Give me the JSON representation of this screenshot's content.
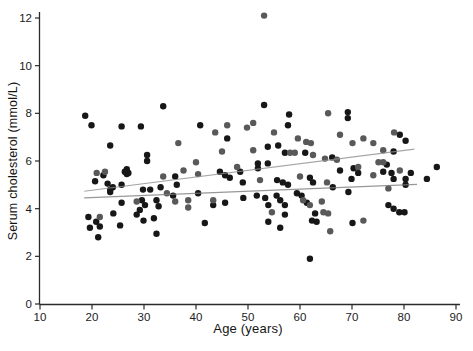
{
  "chart_data": {
    "type": "scatter",
    "title": "",
    "xlabel": "Age (years)",
    "ylabel": "Serum cholesterol (mmol/L)",
    "xlim": [
      10,
      90
    ],
    "ylim": [
      0,
      12
    ],
    "xticks": [
      10,
      20,
      30,
      40,
      50,
      60,
      70,
      80,
      90
    ],
    "yticks": [
      0,
      2,
      4,
      6,
      8,
      10,
      12
    ],
    "grid": false,
    "legend": "none",
    "marker": "filled-circle",
    "marker_radius_px": 3.2,
    "axis_color": "#2b2b2b",
    "series": [
      {
        "name": "black-points",
        "color": "#171717",
        "points": [
          [
            18.7,
            7.9
          ],
          [
            19.9,
            7.5
          ],
          [
            25.7,
            7.45
          ],
          [
            29.4,
            7.45
          ],
          [
            33.7,
            8.3
          ],
          [
            23.5,
            6.65
          ],
          [
            30.6,
            6.25
          ],
          [
            30.6,
            6.0
          ],
          [
            26.7,
            5.65
          ],
          [
            26.7,
            5.45
          ],
          [
            22.2,
            5.4
          ],
          [
            20.6,
            5.15
          ],
          [
            23.0,
            5.05
          ],
          [
            25.7,
            5.0
          ],
          [
            36.0,
            5.35
          ],
          [
            33.2,
            4.9
          ],
          [
            36.3,
            5.0
          ],
          [
            24.0,
            4.9
          ],
          [
            23.5,
            4.7
          ],
          [
            26.3,
            5.55
          ],
          [
            27.0,
            5.5
          ],
          [
            19.3,
            3.65
          ],
          [
            24.1,
            3.8
          ],
          [
            19.6,
            3.2
          ],
          [
            20.8,
            3.45
          ],
          [
            21.5,
            3.25
          ],
          [
            25.4,
            3.3
          ],
          [
            21.2,
            2.8
          ],
          [
            23.5,
            4.8
          ],
          [
            29.8,
            4.8
          ],
          [
            31.2,
            4.8
          ],
          [
            25.7,
            4.25
          ],
          [
            29.6,
            4.35
          ],
          [
            30.2,
            4.15
          ],
          [
            29.2,
            3.95
          ],
          [
            28.6,
            3.75
          ],
          [
            29.9,
            3.5
          ],
          [
            32.4,
            4.35
          ],
          [
            32.8,
            4.1
          ],
          [
            35.6,
            4.55
          ],
          [
            40.4,
            4.65
          ],
          [
            31.9,
            3.6
          ],
          [
            32.4,
            2.95
          ],
          [
            40.8,
            7.5
          ],
          [
            53.1,
            8.35
          ],
          [
            57.9,
            7.95
          ],
          [
            46.0,
            6.95
          ],
          [
            57.7,
            7.5
          ],
          [
            53.8,
            6.6
          ],
          [
            55.8,
            6.65
          ],
          [
            57.1,
            6.35
          ],
          [
            61.0,
            6.35
          ],
          [
            66.2,
            6.15
          ],
          [
            51.9,
            5.9
          ],
          [
            51.9,
            5.7
          ],
          [
            53.8,
            5.9
          ],
          [
            48.5,
            5.55
          ],
          [
            44.6,
            5.55
          ],
          [
            45.6,
            5.4
          ],
          [
            46.5,
            5.3
          ],
          [
            49.0,
            5.1
          ],
          [
            55.6,
            5.2
          ],
          [
            56.7,
            5.1
          ],
          [
            57.7,
            5.0
          ],
          [
            61.9,
            5.3
          ],
          [
            62.5,
            5.1
          ],
          [
            66.3,
            4.9
          ],
          [
            69.2,
            8.05
          ],
          [
            69.2,
            7.8
          ],
          [
            79.2,
            7.1
          ],
          [
            80.3,
            6.85
          ],
          [
            78.0,
            6.4
          ],
          [
            67.7,
            5.6
          ],
          [
            70.3,
            5.7
          ],
          [
            71.2,
            5.5
          ],
          [
            69.9,
            5.25
          ],
          [
            76.7,
            5.85
          ],
          [
            76.0,
            5.55
          ],
          [
            77.6,
            5.5
          ],
          [
            78.0,
            5.25
          ],
          [
            80.3,
            5.25
          ],
          [
            80.3,
            5.0
          ],
          [
            81.3,
            5.5
          ],
          [
            84.4,
            5.25
          ],
          [
            86.3,
            5.75
          ],
          [
            43.3,
            4.15
          ],
          [
            45.6,
            4.25
          ],
          [
            41.7,
            3.4
          ],
          [
            49.1,
            4.45
          ],
          [
            51.7,
            4.55
          ],
          [
            53.3,
            4.45
          ],
          [
            53.9,
            4.15
          ],
          [
            53.9,
            3.45
          ],
          [
            55.5,
            4.55
          ],
          [
            56.2,
            4.35
          ],
          [
            57.1,
            4.15
          ],
          [
            57.1,
            3.75
          ],
          [
            56.2,
            3.2
          ],
          [
            59.4,
            4.65
          ],
          [
            60.3,
            4.55
          ],
          [
            61.3,
            4.25
          ],
          [
            62.9,
            3.8
          ],
          [
            62.3,
            3.5
          ],
          [
            63.2,
            3.45
          ],
          [
            61.9,
            1.9
          ],
          [
            69.3,
            4.7
          ],
          [
            77.0,
            4.15
          ],
          [
            78.0,
            4.0
          ],
          [
            79.1,
            3.85
          ],
          [
            80.1,
            3.85
          ],
          [
            70.1,
            3.4
          ]
        ]
      },
      {
        "name": "gray-points",
        "color": "#595959",
        "points": [
          [
            53.1,
            12.1
          ],
          [
            36.6,
            6.75
          ],
          [
            33.7,
            5.35
          ],
          [
            37.6,
            5.6
          ],
          [
            40.0,
            5.95
          ],
          [
            40.4,
            5.45
          ],
          [
            20.9,
            5.5
          ],
          [
            22.5,
            5.55
          ],
          [
            21.5,
            3.65
          ],
          [
            28.6,
            4.3
          ],
          [
            34.4,
            4.65
          ],
          [
            36.0,
            4.3
          ],
          [
            38.5,
            4.35
          ],
          [
            38.5,
            4.05
          ],
          [
            65.4,
            8.0
          ],
          [
            51.0,
            7.6
          ],
          [
            43.7,
            7.2
          ],
          [
            46.0,
            7.5
          ],
          [
            49.8,
            7.4
          ],
          [
            55.0,
            7.2
          ],
          [
            59.6,
            6.95
          ],
          [
            61.2,
            6.8
          ],
          [
            62.1,
            6.75
          ],
          [
            45.0,
            6.4
          ],
          [
            51.0,
            6.45
          ],
          [
            58.1,
            6.35
          ],
          [
            59.0,
            6.35
          ],
          [
            62.5,
            6.25
          ],
          [
            64.8,
            6.1
          ],
          [
            67.1,
            6.05
          ],
          [
            47.9,
            5.75
          ],
          [
            52.3,
            5.2
          ],
          [
            60.0,
            5.35
          ],
          [
            65.2,
            5.1
          ],
          [
            67.7,
            7.1
          ],
          [
            70.1,
            6.75
          ],
          [
            72.2,
            6.95
          ],
          [
            74.1,
            6.75
          ],
          [
            78.1,
            7.2
          ],
          [
            76.0,
            6.45
          ],
          [
            71.2,
            5.75
          ],
          [
            74.1,
            5.4
          ],
          [
            75.1,
            5.95
          ],
          [
            76.0,
            5.95
          ],
          [
            79.2,
            5.6
          ],
          [
            77.0,
            4.85
          ],
          [
            43.3,
            4.35
          ],
          [
            54.6,
            3.85
          ],
          [
            60.6,
            4.35
          ],
          [
            61.9,
            4.15
          ],
          [
            64.2,
            4.3
          ],
          [
            64.5,
            3.85
          ],
          [
            65.4,
            3.8
          ],
          [
            65.8,
            3.05
          ],
          [
            72.2,
            3.5
          ]
        ]
      }
    ],
    "trend_lines": [
      {
        "name": "upper-trend-line",
        "color": "#8f8f8f",
        "x": [
          18.5,
          82.0
        ],
        "y": [
          4.73,
          6.5
        ]
      },
      {
        "name": "lower-trend-line",
        "color": "#7d7d7d",
        "x": [
          18.5,
          82.5
        ],
        "y": [
          4.45,
          5.02
        ]
      }
    ]
  }
}
